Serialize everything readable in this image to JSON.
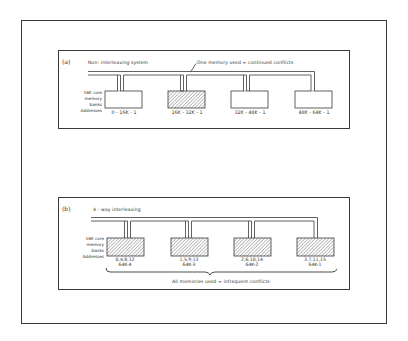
{
  "colors": {
    "line": "#3a3a3a",
    "background": "#ffffff",
    "hatch": "#4a4a4a"
  },
  "panel_a": {
    "tag": "(a)",
    "title": "Non- interleaving system",
    "annotation": "One memory used = continued conflicts",
    "side_labels": [
      "16K core",
      "memory",
      "banks",
      "Addresses"
    ],
    "banks": [
      {
        "address": "0 - 16K - 1",
        "hatched": false
      },
      {
        "address": "16K - 32K - 1",
        "hatched": true
      },
      {
        "address": "32K - 48K - 1",
        "hatched": false
      },
      {
        "address": "48K - 64K - 1",
        "hatched": false
      }
    ]
  },
  "panel_b": {
    "tag": "(b)",
    "title": "4 - way interleaving",
    "side_labels": [
      "16K core",
      "memory",
      "banks",
      "Addresses"
    ],
    "banks": [
      {
        "addresses": "0,4,8,12",
        "last": "64K-4",
        "hatched": true
      },
      {
        "addresses": "1,5,9,13",
        "last": "64K-3",
        "hatched": true
      },
      {
        "addresses": "2,6,10,14",
        "last": "64K-2",
        "hatched": true
      },
      {
        "addresses": "3,7,11,15",
        "last": "64K-1",
        "hatched": true
      }
    ],
    "footer": "All memories used = infrequent conflicts"
  }
}
